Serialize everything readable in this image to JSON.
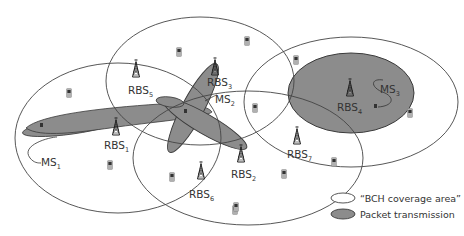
{
  "diagram": {
    "colors": {
      "coverage_stroke": "#444444",
      "packet_fill": "#8c8c8c",
      "packet_stroke": "#3a3a3a",
      "text": "#333333",
      "background": "#ffffff"
    },
    "base_stations": [
      {
        "id": "RBS1",
        "prefix": "RBS",
        "sub": "1"
      },
      {
        "id": "RBS2",
        "prefix": "RBS",
        "sub": "2"
      },
      {
        "id": "RBS3",
        "prefix": "RBS",
        "sub": "3"
      },
      {
        "id": "RBS4",
        "prefix": "RBS",
        "sub": "4"
      },
      {
        "id": "RBS5",
        "prefix": "RBS",
        "sub": "5"
      },
      {
        "id": "RBS6",
        "prefix": "RBS",
        "sub": "6"
      },
      {
        "id": "RBS7",
        "prefix": "RBS",
        "sub": "7"
      }
    ],
    "mobile_stations": [
      {
        "id": "MS1",
        "prefix": "MS",
        "sub": "1"
      },
      {
        "id": "MS2",
        "prefix": "MS",
        "sub": "2"
      },
      {
        "id": "MS3",
        "prefix": "MS",
        "sub": "3"
      }
    ],
    "legend": {
      "coverage_label": "“BCH coverage area”",
      "packet_label": "Packet transmission"
    }
  }
}
